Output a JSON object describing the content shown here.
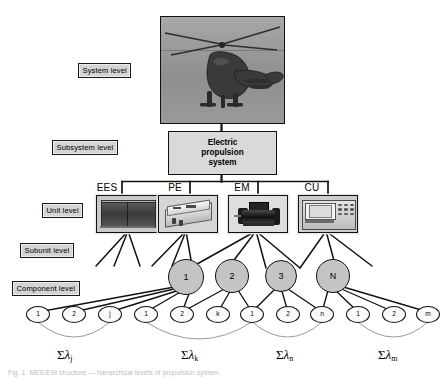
{
  "figure": {
    "caption": "Fig. 1.  MEE/EM structure  —  hierarchical levels of propulsion system"
  },
  "levels": [
    {
      "id": "system",
      "label": "System level"
    },
    {
      "id": "subsystem",
      "label": "Subsystem level"
    },
    {
      "id": "unit",
      "label": "Unit level"
    },
    {
      "id": "subunit",
      "label": "Subunit level"
    },
    {
      "id": "component",
      "label": "Component level"
    }
  ],
  "system": {
    "image_name": "helicopter-photo",
    "alt": "Military transport helicopter in flight"
  },
  "subsystem": {
    "label": "Electric\npropulsion\nsystem",
    "line1": "Electric",
    "line2": "propulsion",
    "line3": "system"
  },
  "units": [
    {
      "id": "ees",
      "label": "EES",
      "image_name": "energy-storage-image"
    },
    {
      "id": "pe",
      "label": "PE",
      "image_name": "power-electronics-image"
    },
    {
      "id": "em",
      "label": "EM",
      "image_name": "electric-motor-image"
    },
    {
      "id": "cu",
      "label": "CU",
      "image_name": "control-unit-image"
    }
  ],
  "subunits": [
    {
      "id": "s1",
      "label": "1"
    },
    {
      "id": "s2",
      "label": "2"
    },
    {
      "id": "s3",
      "label": "3"
    },
    {
      "id": "sN",
      "label": "N"
    }
  ],
  "component_groups": [
    {
      "parent": "1",
      "nodes": [
        {
          "label": "1"
        },
        {
          "label": "2"
        },
        {
          "label": "j"
        }
      ],
      "sum": {
        "sigma": "Σ",
        "lambda": "λ",
        "subscript": "j"
      }
    },
    {
      "parent": "2",
      "nodes": [
        {
          "label": "1"
        },
        {
          "label": "2"
        },
        {
          "label": "k"
        }
      ],
      "sum": {
        "sigma": "Σ",
        "lambda": "λ",
        "subscript": "k"
      }
    },
    {
      "parent": "3",
      "nodes": [
        {
          "label": "1"
        },
        {
          "label": "2"
        },
        {
          "label": "n"
        }
      ],
      "sum": {
        "sigma": "Σ",
        "lambda": "λ",
        "subscript": "n"
      }
    },
    {
      "parent": "N",
      "nodes": [
        {
          "label": "1"
        },
        {
          "label": "2"
        },
        {
          "label": "m"
        }
      ],
      "sum": {
        "sigma": "Σ",
        "lambda": "λ",
        "subscript": "m"
      }
    }
  ],
  "colors": {
    "tag_fill": "#d4d4d4",
    "box_fill": "#d9d9d9",
    "subunit_fill": "#c4c4c4",
    "component_fill": "#fbfbfb",
    "stroke": "#111111",
    "page_bg": "#ffffff"
  }
}
